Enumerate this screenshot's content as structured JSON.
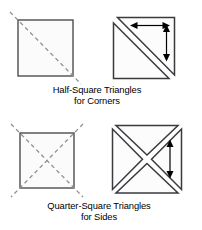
{
  "document": {
    "title": "Cutting Diagrams for Setting Triangles",
    "background_color": "#ffffff"
  },
  "style": {
    "shape_stroke": "#4d4d52",
    "shape_fill": "#fbfbfb",
    "triangle_stroke": "#3a3a3f",
    "triangle_fill": "#fcfcfc",
    "dash_color": "#8e8e96",
    "arrow_color": "#000000",
    "text_color": "#000000"
  },
  "figures": [
    {
      "id": "half-square-source",
      "name": "square-with-single-diagonal",
      "description": "Square with one dashed diagonal cut line from top-left to bottom-right",
      "shape": "square",
      "cut_lines": 1,
      "cut_style": "dashed"
    },
    {
      "id": "half-square-result",
      "name": "half-square-triangle-unit",
      "description": "Square cut into two half-square triangles with grainline arrows",
      "shape": "two-triangles",
      "arrows": [
        "horizontal-double",
        "vertical-double"
      ]
    },
    {
      "id": "quarter-square-source",
      "name": "square-with-both-diagonals",
      "description": "Square with two dashed diagonal cut lines forming an X",
      "shape": "square",
      "cut_lines": 2,
      "cut_style": "dashed"
    },
    {
      "id": "quarter-square-result",
      "name": "quarter-square-triangle-unit",
      "description": "Square cut into four quarter-square triangles with grainline arrow",
      "shape": "four-triangles",
      "arrows": [
        "vertical-double"
      ]
    }
  ],
  "captions": {
    "half_square": {
      "line1": "Half-Square Triangles",
      "line2": "for Corners"
    },
    "quarter_square": {
      "line1": "Quarter-Square Triangles",
      "line2": "for Sides"
    }
  }
}
